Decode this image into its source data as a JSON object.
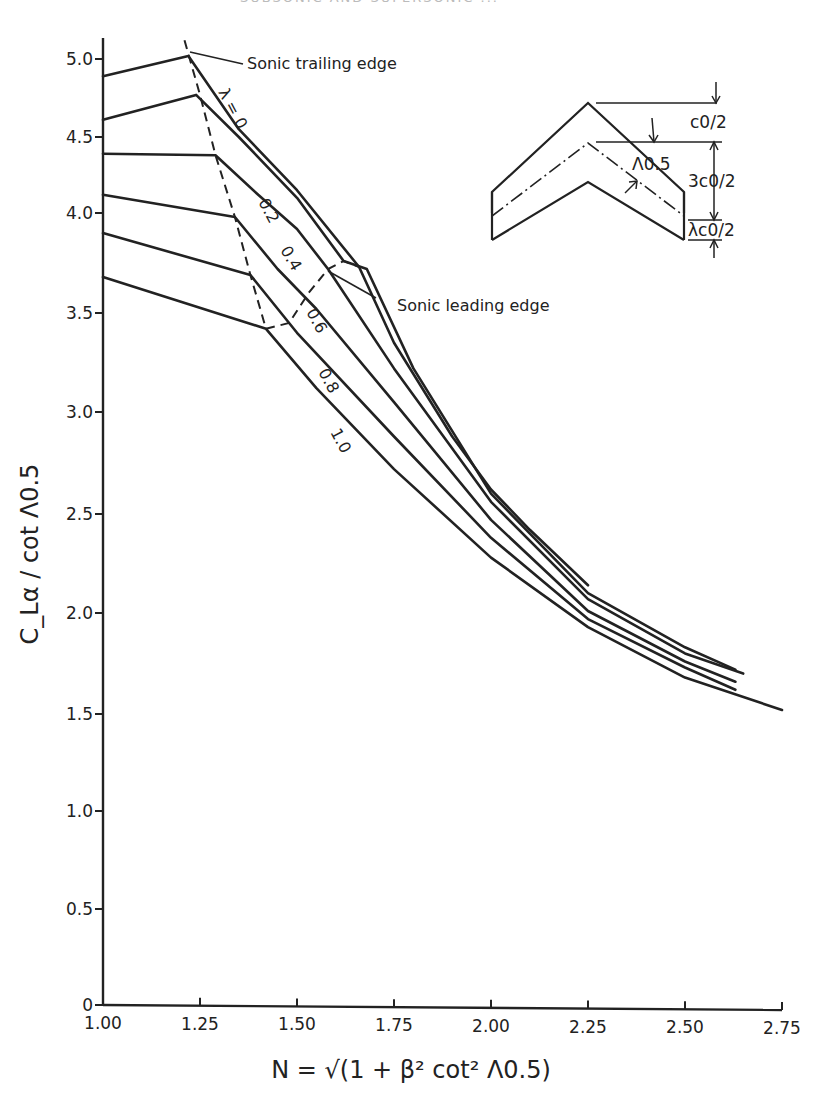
{
  "page": {
    "top_cutoff_text": "SUBSONIC AND SUPERSONIC ..."
  },
  "chart_data": {
    "type": "line",
    "title": "",
    "xlabel": "N = √(1 + β² cot² Λ0.5)",
    "ylabel": "C_Lα / cot Λ0.5",
    "xlim": [
      1.0,
      2.75
    ],
    "ylim": [
      0,
      5.0
    ],
    "x_ticks": [
      "1.00",
      "1.25",
      "1.50",
      "1.75",
      "2.00",
      "2.25",
      "2.50",
      "2.75"
    ],
    "y_ticks": [
      "0",
      "0.5",
      "1.0",
      "1.5",
      "2.0",
      "2.5",
      "3.0",
      "3.5",
      "4.0",
      "4.5",
      "5.0"
    ],
    "grid": false,
    "legend": "inline curve labels (λ = taper ratio)",
    "series": [
      {
        "name": "λ = 0",
        "label": "λ = 0",
        "points": [
          [
            1.0,
            4.89
          ],
          [
            1.22,
            5.02
          ],
          [
            1.35,
            4.55
          ],
          [
            1.5,
            4.15
          ],
          [
            1.66,
            3.73
          ],
          [
            1.75,
            3.35
          ],
          [
            1.9,
            2.88
          ],
          [
            2.0,
            2.62
          ],
          [
            2.1,
            2.42
          ],
          [
            2.25,
            2.14
          ]
        ]
      },
      {
        "name": "λ = 0.2",
        "label": "0.2",
        "points": [
          [
            1.0,
            4.61
          ],
          [
            1.24,
            4.77
          ],
          [
            1.35,
            4.5
          ],
          [
            1.5,
            4.1
          ],
          [
            1.62,
            3.76
          ],
          [
            1.68,
            3.72
          ],
          [
            1.8,
            3.22
          ],
          [
            2.0,
            2.6
          ],
          [
            2.25,
            2.1
          ],
          [
            2.5,
            1.83
          ],
          [
            2.63,
            1.72
          ]
        ]
      },
      {
        "name": "λ = 0.4",
        "label": "0.4",
        "points": [
          [
            1.0,
            4.39
          ],
          [
            1.29,
            4.38
          ],
          [
            1.4,
            4.12
          ],
          [
            1.5,
            3.92
          ],
          [
            1.58,
            3.72
          ],
          [
            1.75,
            3.22
          ],
          [
            2.0,
            2.56
          ],
          [
            2.25,
            2.07
          ],
          [
            2.5,
            1.8
          ],
          [
            2.65,
            1.7
          ]
        ]
      },
      {
        "name": "λ = 0.6",
        "label": "0.6",
        "points": [
          [
            1.0,
            4.12
          ],
          [
            1.34,
            3.98
          ],
          [
            1.45,
            3.72
          ],
          [
            1.55,
            3.52
          ],
          [
            1.75,
            3.05
          ],
          [
            2.0,
            2.47
          ],
          [
            2.25,
            2.01
          ],
          [
            2.5,
            1.76
          ],
          [
            2.63,
            1.66
          ]
        ]
      },
      {
        "name": "λ = 0.8",
        "label": "0.8",
        "points": [
          [
            1.0,
            3.9
          ],
          [
            1.38,
            3.69
          ],
          [
            1.5,
            3.4
          ],
          [
            1.75,
            2.88
          ],
          [
            2.0,
            2.38
          ],
          [
            2.25,
            1.97
          ],
          [
            2.5,
            1.73
          ],
          [
            2.63,
            1.62
          ]
        ]
      },
      {
        "name": "λ = 1.0",
        "label": "1.0",
        "points": [
          [
            1.0,
            3.68
          ],
          [
            1.42,
            3.42
          ],
          [
            1.55,
            3.12
          ],
          [
            1.75,
            2.72
          ],
          [
            2.0,
            2.28
          ],
          [
            2.25,
            1.93
          ],
          [
            2.5,
            1.68
          ],
          [
            2.75,
            1.52
          ]
        ]
      }
    ],
    "boundaries": [
      {
        "name": "Sonic trailing edge",
        "style": "dashed",
        "points": [
          [
            1.21,
            5.12
          ],
          [
            1.25,
            4.77
          ],
          [
            1.29,
            4.38
          ],
          [
            1.34,
            3.98
          ],
          [
            1.38,
            3.69
          ],
          [
            1.42,
            3.42
          ]
        ]
      },
      {
        "name": "Sonic leading edge",
        "style": "dashed",
        "points": [
          [
            1.42,
            3.42
          ],
          [
            1.48,
            3.45
          ],
          [
            1.53,
            3.6
          ],
          [
            1.58,
            3.72
          ],
          [
            1.62,
            3.76
          ],
          [
            1.66,
            3.73
          ]
        ]
      }
    ],
    "annotations": [
      {
        "text": "Sonic trailing edge",
        "x": 1.45,
        "y": 4.98
      },
      {
        "text": "Sonic leading edge",
        "x": 1.74,
        "y": 3.58
      }
    ],
    "inset_diagram": {
      "labels": [
        "c0/2",
        "3c0/2",
        "λc0/2",
        "Λ0.5"
      ]
    }
  }
}
